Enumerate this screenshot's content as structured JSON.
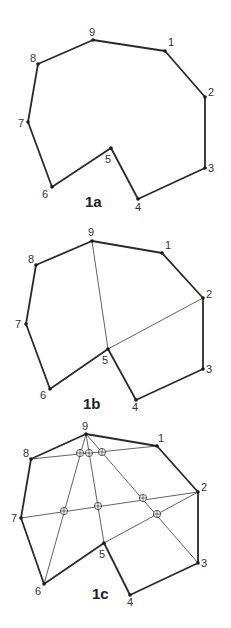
{
  "figure": {
    "panels": [
      {
        "id": "1a",
        "caption": "1a",
        "caption_pos": [
          85,
          207
        ],
        "vertices": [
          {
            "label": "1",
            "x": 165,
            "y": 51,
            "lx": 168,
            "ly": 46
          },
          {
            "label": "2",
            "x": 205,
            "y": 97,
            "lx": 208,
            "ly": 96
          },
          {
            "label": "3",
            "x": 205,
            "y": 168,
            "lx": 208,
            "ly": 172
          },
          {
            "label": "4",
            "x": 138,
            "y": 199,
            "lx": 135,
            "ly": 211
          },
          {
            "label": "5",
            "x": 111,
            "y": 148,
            "lx": 105,
            "ly": 163
          },
          {
            "label": "6",
            "x": 52,
            "y": 187,
            "lx": 42,
            "ly": 198
          },
          {
            "label": "7",
            "x": 28,
            "y": 122,
            "lx": 18,
            "ly": 127
          },
          {
            "label": "8",
            "x": 38,
            "y": 64,
            "lx": 30,
            "ly": 62
          },
          {
            "label": "9",
            "x": 93,
            "y": 40,
            "lx": 89,
            "ly": 36
          }
        ],
        "chords": [],
        "intersections": []
      },
      {
        "id": "1b",
        "caption": "1b",
        "caption_pos": [
          83,
          409
        ],
        "vertices": [
          {
            "label": "1",
            "x": 162,
            "y": 253,
            "lx": 165,
            "ly": 249
          },
          {
            "label": "2",
            "x": 203,
            "y": 298,
            "lx": 206,
            "ly": 298
          },
          {
            "label": "3",
            "x": 203,
            "y": 369,
            "lx": 206,
            "ly": 373
          },
          {
            "label": "4",
            "x": 136,
            "y": 400,
            "lx": 132,
            "ly": 411
          },
          {
            "label": "5",
            "x": 108,
            "y": 349,
            "lx": 102,
            "ly": 364
          },
          {
            "label": "6",
            "x": 50,
            "y": 389,
            "lx": 40,
            "ly": 399
          },
          {
            "label": "7",
            "x": 26,
            "y": 324,
            "lx": 15,
            "ly": 328
          },
          {
            "label": "8",
            "x": 36,
            "y": 265,
            "lx": 28,
            "ly": 263
          },
          {
            "label": "9",
            "x": 92,
            "y": 241,
            "lx": 88,
            "ly": 236
          }
        ],
        "chords": [
          [
            "9",
            "5"
          ],
          [
            "5",
            "2"
          ]
        ],
        "intersections": []
      },
      {
        "id": "1c",
        "caption": "1c",
        "caption_pos": [
          92,
          599
        ],
        "vertices": [
          {
            "label": "1",
            "x": 157,
            "y": 446,
            "lx": 158,
            "ly": 442
          },
          {
            "label": "2",
            "x": 198,
            "y": 492,
            "lx": 201,
            "ly": 491
          },
          {
            "label": "3",
            "x": 198,
            "y": 563,
            "lx": 201,
            "ly": 567
          },
          {
            "label": "4",
            "x": 130,
            "y": 595,
            "lx": 127,
            "ly": 606
          },
          {
            "label": "5",
            "x": 104,
            "y": 543,
            "lx": 99,
            "ly": 558
          },
          {
            "label": "6",
            "x": 44,
            "y": 584,
            "lx": 35,
            "ly": 595
          },
          {
            "label": "7",
            "x": 21,
            "y": 518,
            "lx": 11,
            "ly": 522
          },
          {
            "label": "8",
            "x": 31,
            "y": 459,
            "lx": 23,
            "ly": 457
          },
          {
            "label": "9",
            "x": 86,
            "y": 434,
            "lx": 82,
            "ly": 430
          }
        ],
        "chords": [
          [
            "9",
            "6"
          ],
          [
            "9",
            "5"
          ],
          [
            "9",
            "3"
          ],
          [
            "8",
            "1"
          ],
          [
            "7",
            "2"
          ],
          [
            "5",
            "2"
          ]
        ],
        "intersections": [
          {
            "x": 80,
            "y": 453
          },
          {
            "x": 89,
            "y": 453
          },
          {
            "x": 102,
            "y": 452
          },
          {
            "x": 64,
            "y": 511
          },
          {
            "x": 98,
            "y": 506
          },
          {
            "x": 143,
            "y": 498
          },
          {
            "x": 157,
            "y": 514
          }
        ]
      }
    ]
  }
}
